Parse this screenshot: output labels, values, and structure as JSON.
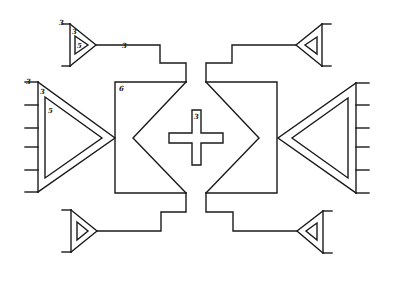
{
  "diagram": {
    "title": "",
    "background": "#ffffff",
    "stroke_color": "#1a1a1a",
    "labels": {
      "top_left_amp_outer": "3",
      "top_left_amp_mid": "3",
      "top_left_amp_inner": "5",
      "top_left_output": "3",
      "left_amp_outer": "3",
      "left_amp_mid": "3",
      "left_amp_inner": "5",
      "left_block": "6",
      "center_cross": "3"
    },
    "components": [
      {
        "id": "top-left-small-triangle",
        "shape": "triangle",
        "direction": "right"
      },
      {
        "id": "top-right-small-triangle",
        "shape": "triangle",
        "direction": "left"
      },
      {
        "id": "bottom-left-small-triangle",
        "shape": "triangle",
        "direction": "right"
      },
      {
        "id": "bottom-right-small-triangle",
        "shape": "triangle",
        "direction": "left"
      },
      {
        "id": "left-large-triangle",
        "shape": "triangle",
        "direction": "right",
        "inputs": 6
      },
      {
        "id": "right-large-triangle",
        "shape": "triangle",
        "direction": "left",
        "inputs": 6
      },
      {
        "id": "left-block",
        "shape": "notched-rectangle"
      },
      {
        "id": "right-block",
        "shape": "notched-rectangle"
      },
      {
        "id": "center-cross",
        "shape": "plus"
      }
    ]
  }
}
